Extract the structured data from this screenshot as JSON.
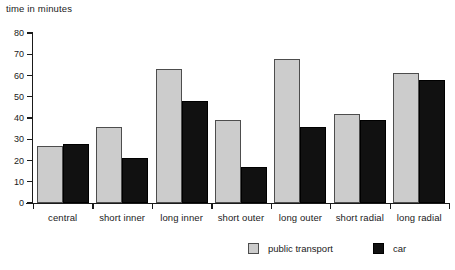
{
  "chart_data": {
    "type": "bar",
    "title": "",
    "xlabel": "",
    "ylabel": "time in minutes",
    "ylim": [
      0,
      80
    ],
    "ytick_step": 10,
    "yticks": [
      0,
      10,
      20,
      30,
      40,
      50,
      60,
      70,
      80
    ],
    "grid": false,
    "legend_position": "bottom",
    "categories": [
      "central",
      "short inner",
      "long inner",
      "short outer",
      "long outer",
      "short radial",
      "long radial"
    ],
    "series": [
      {
        "name": "public transport",
        "color": "#cccccc",
        "values": [
          27,
          36,
          63,
          39,
          68,
          42,
          61
        ]
      },
      {
        "name": "car",
        "color": "#111111",
        "values": [
          28,
          21,
          48,
          17,
          36,
          39,
          58
        ]
      }
    ]
  },
  "legend": {
    "entries": [
      {
        "label": "public transport",
        "swatch": "public"
      },
      {
        "label": "car",
        "swatch": "car"
      }
    ]
  }
}
